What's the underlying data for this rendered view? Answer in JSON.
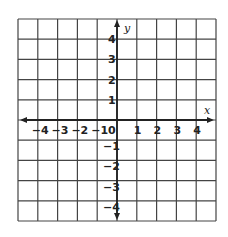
{
  "chart_data": {
    "type": "coordinate-grid",
    "title": "",
    "xlabel": "x",
    "ylabel": "y",
    "xlim": [
      -5,
      5
    ],
    "ylim": [
      -5,
      5
    ],
    "grid": true,
    "x_ticks": [
      {
        "value": -4,
        "label": "−4"
      },
      {
        "value": -3,
        "label": "−3"
      },
      {
        "value": -2,
        "label": "−2"
      },
      {
        "value": -1,
        "label": "−1"
      },
      {
        "value": 0,
        "label": "0"
      },
      {
        "value": 1,
        "label": "1"
      },
      {
        "value": 2,
        "label": "2"
      },
      {
        "value": 3,
        "label": "3"
      },
      {
        "value": 4,
        "label": "4"
      }
    ],
    "y_ticks": [
      {
        "value": 4,
        "label": "4"
      },
      {
        "value": 3,
        "label": "3"
      },
      {
        "value": 2,
        "label": "2"
      },
      {
        "value": 1,
        "label": "1"
      },
      {
        "value": -1,
        "label": "−1"
      },
      {
        "value": -2,
        "label": "−2"
      },
      {
        "value": -3,
        "label": "−3"
      },
      {
        "value": -4,
        "label": "−4"
      }
    ],
    "series": []
  },
  "colors": {
    "grid": "#444444",
    "axis": "#222222",
    "background": "#ffffff"
  }
}
